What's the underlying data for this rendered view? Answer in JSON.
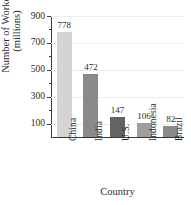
{
  "chart_data": {
    "type": "bar",
    "title": "",
    "xlabel": "Country",
    "ylabel": "Number of Workers (millions)",
    "ylabel_line1": "Number of Workers",
    "ylabel_line2": "(millions)",
    "categories": [
      "China",
      "India",
      "U.S.",
      "Indonesia",
      "Brazil"
    ],
    "values": [
      778,
      472,
      147,
      106,
      82
    ],
    "value_labels": [
      "778",
      "472",
      "147",
      "106",
      "82"
    ],
    "bar_colors": [
      "#d4d4d4",
      "#8a8a8a",
      "#636363",
      "#9e9e9e",
      "#8a8a8a"
    ],
    "ylim": [
      0,
      900
    ],
    "y_major_ticks": [
      100,
      300,
      500,
      700,
      900
    ],
    "y_major_tick_labels": [
      "100",
      "300",
      "500",
      "700",
      "900"
    ],
    "y_minor_ticks": [
      200,
      400,
      600,
      800
    ],
    "grid": true,
    "legend": "none"
  }
}
